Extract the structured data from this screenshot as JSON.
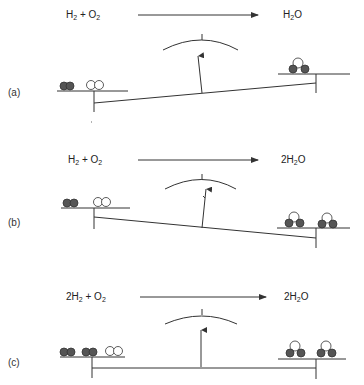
{
  "figure": {
    "panels": [
      {
        "label": "(a)",
        "reactants": {
          "coef1": "",
          "sp1": "H",
          "sub1": "2",
          "plus": " + ",
          "coef2": "",
          "sp2": "O",
          "sub2": "2"
        },
        "products": {
          "coef": "",
          "sp": "H",
          "sub": "2",
          "tail": "O"
        },
        "balance_state": "tilted up to the right (products side heavier? no — reactants lighter side raised left, products side high)",
        "left_molecules": [
          "H2 (filled pair)",
          "O2 (open pair)"
        ],
        "right_molecules": [
          "H2O (two filled + one open)"
        ]
      },
      {
        "label": "(b)",
        "reactants": {
          "coef1": "",
          "sp1": "H",
          "sub1": "2",
          "plus": " + ",
          "coef2": "",
          "sp2": "O",
          "sub2": "2"
        },
        "products": {
          "coef": "2",
          "sp": "H",
          "sub": "2",
          "tail": "O"
        },
        "balance_state": "tilted down to the right",
        "left_molecules": [
          "H2 (filled pair)",
          "O2 (open pair)"
        ],
        "right_molecules": [
          "H2O",
          "H2O"
        ]
      },
      {
        "label": "(c)",
        "reactants": {
          "coef1": "2",
          "sp1": "H",
          "sub1": "2",
          "plus": " + ",
          "coef2": "",
          "sp2": "O",
          "sub2": "2"
        },
        "products": {
          "coef": "2",
          "sp": "H",
          "sub": "2",
          "tail": "O"
        },
        "balance_state": "level (balanced)",
        "left_molecules": [
          "H2",
          "H2",
          "O2"
        ],
        "right_molecules": [
          "H2O",
          "H2O"
        ]
      }
    ],
    "colors": {
      "line": "#333333",
      "filled_atom": "#555555",
      "open_atom": "#ffffff"
    }
  }
}
